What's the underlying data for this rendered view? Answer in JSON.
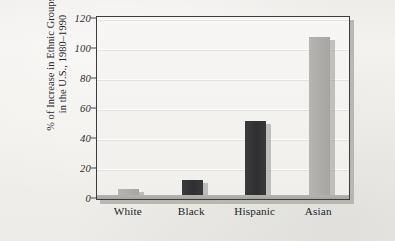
{
  "chart_data": {
    "type": "bar",
    "title": "",
    "subtitle": "",
    "xlabel": "",
    "ylabel": "% of Increase in Ethnic Groups in the U.S., 1980–1990",
    "ylabel_lines": [
      "% of Increase in Ethnic Groups",
      "in the U.S., 1980–1990"
    ],
    "categories": [
      "White",
      "Black",
      "Hispanic",
      "Asian"
    ],
    "values": [
      7,
      13,
      52,
      108
    ],
    "bar_styles": [
      "light",
      "dark",
      "dark",
      "light"
    ],
    "ylim": [
      0,
      120
    ],
    "yticks": [
      0,
      20,
      40,
      60,
      80,
      100,
      120
    ],
    "ytick_labels": [
      "0",
      "20",
      "40",
      "60",
      "80",
      "100",
      "120"
    ],
    "grid": true,
    "legend": false,
    "legend_position": "none"
  },
  "colors": {
    "page_background": "#f2f0ec",
    "plot_background": "#f4f2ef",
    "frame": "#3b3c40",
    "bar_light": "#adaca8",
    "bar_dark": "#303032",
    "gridline": "#ffffff",
    "text": "#25262a"
  }
}
